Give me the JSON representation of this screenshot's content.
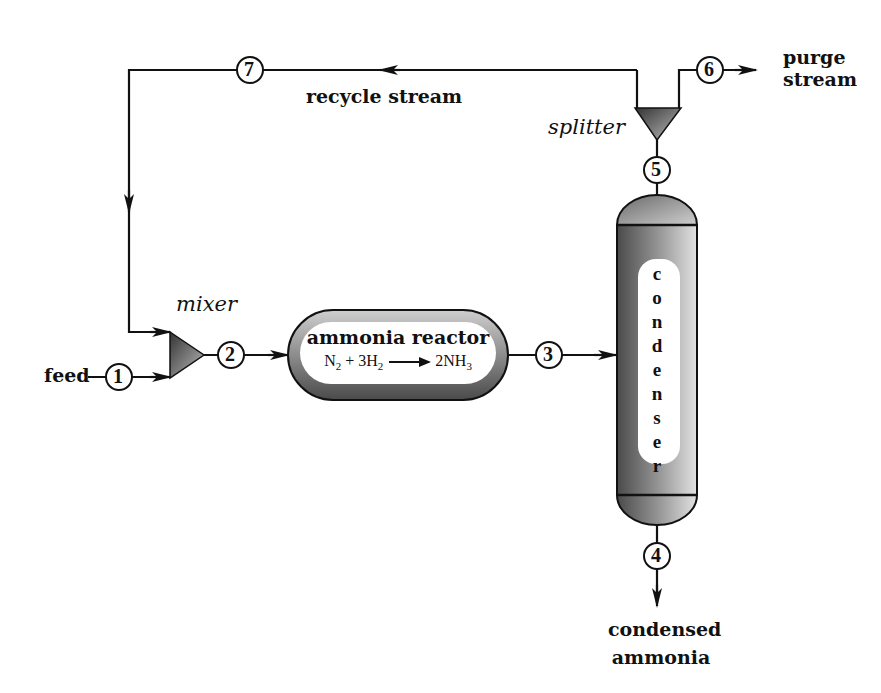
{
  "diagram": {
    "type": "process-flow-diagram",
    "units": {
      "mixer": {
        "label": "mixer"
      },
      "reactor": {
        "label": "ammonia reactor",
        "reaction": {
          "lhs": "N",
          "lhs_sub": "2",
          "plus": " + 3H",
          "h_sub": "2",
          "rhs": "2NH",
          "rhs_sub": "3"
        }
      },
      "condenser": {
        "label": "condenser",
        "letters": [
          "c",
          "o",
          "n",
          "d",
          "e",
          "n",
          "s",
          "e",
          "r"
        ]
      },
      "splitter": {
        "label": "splitter"
      }
    },
    "streams": [
      {
        "id": "1",
        "label": "1",
        "name": "feed"
      },
      {
        "id": "2",
        "label": "2"
      },
      {
        "id": "3",
        "label": "3"
      },
      {
        "id": "4",
        "label": "4",
        "name_line1": "condensed",
        "name_line2": "ammonia"
      },
      {
        "id": "5",
        "label": "5"
      },
      {
        "id": "6",
        "label": "6",
        "name_line1": "purge",
        "name_line2": "stream"
      },
      {
        "id": "7",
        "label": "7",
        "name": "recycle stream"
      }
    ],
    "colors": {
      "line": "#111111",
      "fill_dark": "#555555",
      "fill_light": "#d8d8d8"
    }
  }
}
